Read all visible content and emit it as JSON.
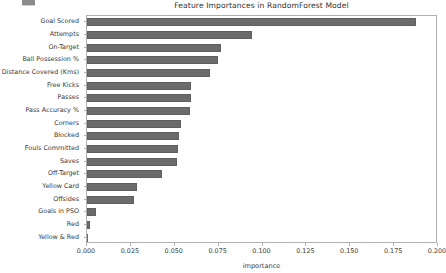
{
  "chart_data": {
    "type": "bar",
    "orientation": "horizontal",
    "title": "Feature Importances in RandomForest Model",
    "xlabel": "importance",
    "ylabel": "",
    "xlim": [
      0.0,
      0.2
    ],
    "grid": false,
    "legend": null,
    "bar_color": "#6b6b6b",
    "xticks": [
      "0.000",
      "0.025",
      "0.050",
      "0.075",
      "0.100",
      "0.125",
      "0.150",
      "0.175",
      "0.200"
    ],
    "xtick_values": [
      0.0,
      0.025,
      0.05,
      0.075,
      0.1,
      0.125,
      0.15,
      0.175,
      0.2
    ],
    "categories": [
      "Goal Scored",
      "Attempts",
      "On-Target",
      "Ball Possession %",
      "Distance Covered (Kms)",
      "Free Kicks",
      "Passes",
      "Pass Accuracy %",
      "Corners",
      "Blocked",
      "Fouls Committed",
      "Saves",
      "Off-Target",
      "Yellow Card",
      "Offsides",
      "Goals in PSO",
      "Red",
      "Yellow & Red"
    ],
    "values": [
      0.1875,
      0.094,
      0.0763,
      0.0746,
      0.07,
      0.0593,
      0.0591,
      0.0586,
      0.0534,
      0.0522,
      0.0518,
      0.0513,
      0.0428,
      0.0285,
      0.0266,
      0.0053,
      0.0019,
      0.0002
    ]
  },
  "figure": {
    "title": "Feature Importances in RandomForest Model"
  }
}
